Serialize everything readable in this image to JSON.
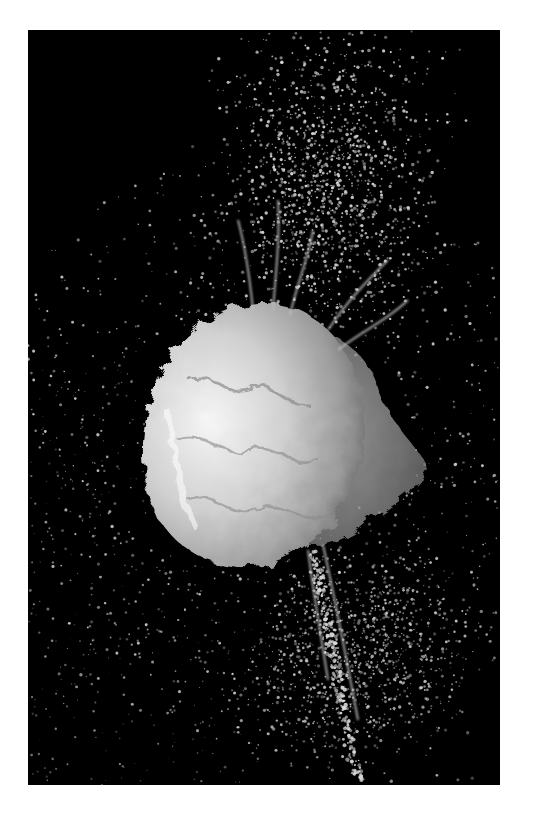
{
  "image": {
    "alt": "High-speed photograph of a water balloon bursting against a black background, with white liquid splash and spray droplets",
    "subject": "bursting water balloon splash",
    "background_color": "#000000",
    "page_background": "#ffffff",
    "frame": {
      "x": 28,
      "y": 30,
      "width": 472,
      "height": 755
    },
    "palette": {
      "splash_highlight": "#f2f2f2",
      "splash_mid": "#bdbdbd",
      "splash_shadow": "#7a7a7a",
      "droplet": "#d8d8d8"
    },
    "regions": {
      "splash_body_center": {
        "x": 245,
        "y": 420
      },
      "spray_plume_top": "upper center-right region dense with droplets",
      "spray_tail_bottom": "narrow streak of droplets descending below center toward bottom right"
    }
  }
}
